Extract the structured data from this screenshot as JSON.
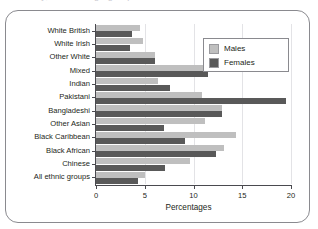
{
  "top_remnant": "ity, sex and age group",
  "legend": {
    "position": "top-right",
    "entries": [
      {
        "label": "Males",
        "color": "#bfbfbf"
      },
      {
        "label": "Females",
        "color": "#595959"
      }
    ]
  },
  "chart_data": {
    "type": "bar",
    "orientation": "horizontal",
    "title": "",
    "xlabel": "Percentages",
    "ylabel": "",
    "xlim": [
      0,
      20
    ],
    "xticks": [
      0,
      5,
      10,
      15,
      20
    ],
    "xtick_labels": [
      "0",
      "5",
      "10",
      "15",
      "20"
    ],
    "grid": "vertical",
    "legend_position": "upper right",
    "categories": [
      "White British",
      "White Irish",
      "Other White",
      "Mixed",
      "Indian",
      "Pakistani",
      "Bangladeshi",
      "Other Asian",
      "Black Caribbean",
      "Black African",
      "Chinese",
      "All ethnic groups"
    ],
    "series": [
      {
        "name": "Males",
        "color": "#bfbfbf",
        "values": [
          4.5,
          4.8,
          6.0,
          12.5,
          6.4,
          10.9,
          12.9,
          11.2,
          14.4,
          13.1,
          9.6,
          5.0
        ]
      },
      {
        "name": "Females",
        "color": "#595959",
        "values": [
          3.7,
          3.5,
          6.0,
          11.5,
          7.6,
          19.5,
          12.9,
          7.0,
          9.1,
          12.3,
          7.1,
          4.3
        ]
      }
    ]
  }
}
